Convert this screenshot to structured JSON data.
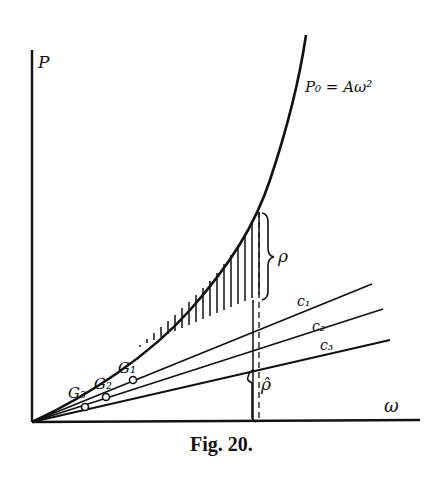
{
  "figure": {
    "caption": "Fig. 20.",
    "axes": {
      "y_label": "P",
      "x_label": "ω"
    },
    "curve_label": "P₀ = Aω²",
    "lines": [
      {
        "id": "c1",
        "label": "c₁"
      },
      {
        "id": "c2",
        "label": "c₂"
      },
      {
        "id": "c3",
        "label": "c₃"
      }
    ],
    "points": [
      {
        "id": "g1",
        "label": "G₁"
      },
      {
        "id": "g2",
        "label": "G₂"
      },
      {
        "id": "g3",
        "label": "G₃"
      }
    ],
    "brace_labels": {
      "upper": "ρ",
      "lower": "ρ̂"
    },
    "colors": {
      "ink": "#111111",
      "paper": "#ffffff"
    }
  }
}
